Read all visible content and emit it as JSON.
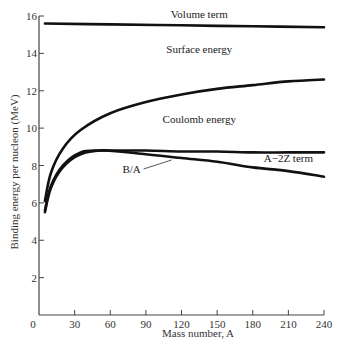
{
  "chart_data": {
    "type": "line",
    "title": "",
    "xlabel": "Mass number, A",
    "ylabel": "Binding energy per nucleon (MeV)",
    "xlim": [
      0,
      240
    ],
    "ylim": [
      0,
      16
    ],
    "x_ticks": [
      0,
      30,
      60,
      90,
      120,
      150,
      180,
      210,
      240
    ],
    "y_ticks": [
      2,
      4,
      6,
      8,
      10,
      12,
      14,
      16
    ],
    "grid": false,
    "legend": "none (inline annotations)",
    "annotations": [
      {
        "text": "Volume term",
        "x": 135,
        "y": 15.9
      },
      {
        "text": "Surface energy",
        "x": 135,
        "y": 14.0
      },
      {
        "text": "Coulomb energy",
        "x": 135,
        "y": 10.3
      },
      {
        "text": "A−2Z term",
        "x": 210,
        "y": 8.2
      },
      {
        "text": "B/A",
        "x": 78,
        "y": 7.6
      }
    ],
    "series": [
      {
        "name": "Volume term",
        "x": [
          5,
          60,
          120,
          180,
          240
        ],
        "y": [
          15.6,
          15.55,
          15.5,
          15.45,
          15.4
        ]
      },
      {
        "name": "Volume − Surface",
        "x": [
          5,
          10,
          20,
          35,
          60,
          90,
          120,
          150,
          180,
          210,
          240
        ],
        "y": [
          6.1,
          7.6,
          8.9,
          9.9,
          10.8,
          11.4,
          11.8,
          12.1,
          12.3,
          12.5,
          12.6
        ]
      },
      {
        "name": "Volume − Surface − Coulomb",
        "x": [
          5,
          10,
          20,
          35,
          50,
          60,
          90,
          120,
          150,
          180,
          210,
          240
        ],
        "y": [
          5.6,
          6.9,
          8.0,
          8.7,
          8.8,
          8.8,
          8.8,
          8.75,
          8.75,
          8.7,
          8.7,
          8.7
        ]
      },
      {
        "name": "B/A",
        "x": [
          5,
          10,
          20,
          35,
          55,
          90,
          120,
          150,
          180,
          210,
          240
        ],
        "y": [
          5.5,
          6.8,
          7.9,
          8.6,
          8.8,
          8.6,
          8.4,
          8.2,
          7.9,
          7.7,
          7.4
        ]
      }
    ]
  }
}
